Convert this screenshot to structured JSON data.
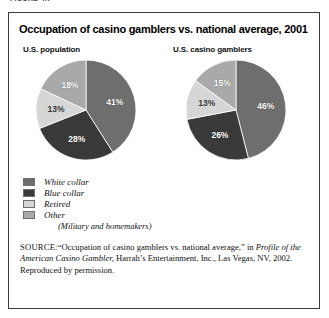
{
  "figure": {
    "cut_caption": "FIGURE 4.7",
    "title": "Occupation of casino gamblers vs. national average, 2001"
  },
  "colors": {
    "white_collar": "#6e6e6e",
    "blue_collar": "#3a3a3a",
    "retired": "#d6d6d6",
    "other": "#a9a9a9",
    "border": "#3d3d3d",
    "background": "#ffffff"
  },
  "legend": {
    "items": [
      {
        "label": "White collar",
        "color": "#6e6e6e"
      },
      {
        "label": "Blue collar",
        "color": "#3a3a3a"
      },
      {
        "label": "Retired",
        "color": "#d6d6d6"
      },
      {
        "label": "Other",
        "color": "#a9a9a9"
      }
    ],
    "other_sub": "(Military and homemakers)"
  },
  "source": {
    "kicker": "SOURCE:",
    "line1_a": "“Occupation of casino gamblers vs. national average,” in ",
    "line1_italic": "Profile",
    "line2_italic": "of the American Casino Gambler,",
    "line2_a": " Harrah’s Entertainment, Inc.,",
    "line3": "Las Vegas, NV, 2002. Reproduced by permission."
  },
  "chart_data": [
    {
      "type": "pie",
      "title": "U.S. population",
      "categories": [
        "White collar",
        "Blue collar",
        "Retired",
        "Other"
      ],
      "values": [
        41,
        28,
        13,
        18
      ],
      "labels": [
        "41%",
        "28%",
        "13%",
        "18%"
      ],
      "colors": [
        "#6e6e6e",
        "#3a3a3a",
        "#d6d6d6",
        "#a9a9a9"
      ],
      "units": "percent",
      "legend_position": "below",
      "grid": false
    },
    {
      "type": "pie",
      "title": "U.S. casino gamblers",
      "categories": [
        "White collar",
        "Blue collar",
        "Retired",
        "Other"
      ],
      "values": [
        46,
        26,
        13,
        15
      ],
      "labels": [
        "46%",
        "26%",
        "13%",
        "15%"
      ],
      "colors": [
        "#6e6e6e",
        "#3a3a3a",
        "#d6d6d6",
        "#a9a9a9"
      ],
      "units": "percent",
      "legend_position": "below",
      "grid": false
    }
  ]
}
